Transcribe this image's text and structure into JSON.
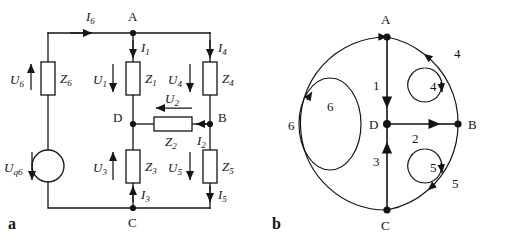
{
  "figure": {
    "captions": {
      "a": "a",
      "b": "b"
    },
    "panel_a": {
      "title": "circuit-diagram",
      "nodes": [
        {
          "id": "A",
          "label": "A",
          "x": 133,
          "y": 33
        },
        {
          "id": "B",
          "label": "B",
          "x": 210,
          "y": 124
        },
        {
          "id": "C",
          "label": "C",
          "x": 133,
          "y": 208
        },
        {
          "id": "D",
          "label": "D",
          "x": 133,
          "y": 124
        }
      ],
      "source": {
        "name": "voltage-source",
        "label_main": "U",
        "label_sub": "q6",
        "arrow": "down",
        "x": 48,
        "y": 166
      },
      "impedances": [
        {
          "name": "Z1",
          "label_main": "Z",
          "label_sub": "1",
          "x": 133,
          "y": 78,
          "orient": "vertical"
        },
        {
          "name": "Z2",
          "label_main": "Z",
          "label_sub": "2",
          "x": 172,
          "y": 124,
          "orient": "horizontal"
        },
        {
          "name": "Z3",
          "label_main": "Z",
          "label_sub": "3",
          "x": 133,
          "y": 166,
          "orient": "vertical"
        },
        {
          "name": "Z4",
          "label_main": "Z",
          "label_sub": "4",
          "x": 210,
          "y": 78,
          "orient": "vertical"
        },
        {
          "name": "Z5",
          "label_main": "Z",
          "label_sub": "5",
          "x": 210,
          "y": 166,
          "orient": "vertical"
        },
        {
          "name": "Z6",
          "label_main": "Z",
          "label_sub": "6",
          "x": 48,
          "y": 78,
          "orient": "vertical"
        }
      ],
      "voltages": [
        {
          "name": "U1",
          "label_main": "U",
          "label_sub": "1",
          "arrow": "down"
        },
        {
          "name": "U2",
          "label_main": "U",
          "label_sub": "2",
          "arrow": "left"
        },
        {
          "name": "U3",
          "label_main": "U",
          "label_sub": "3",
          "arrow": "up"
        },
        {
          "name": "U4",
          "label_main": "U",
          "label_sub": "4",
          "arrow": "down"
        },
        {
          "name": "U5",
          "label_main": "U",
          "label_sub": "5",
          "arrow": "down"
        },
        {
          "name": "U6",
          "label_main": "U",
          "label_sub": "6",
          "arrow": "up"
        }
      ],
      "currents": [
        {
          "name": "I1",
          "label_main": "I",
          "label_sub": "1",
          "arrow": "down"
        },
        {
          "name": "I2",
          "label_main": "I",
          "label_sub": "2",
          "arrow": "left"
        },
        {
          "name": "I3",
          "label_main": "I",
          "label_sub": "3",
          "arrow": "up"
        },
        {
          "name": "I4",
          "label_main": "I",
          "label_sub": "4",
          "arrow": "down"
        },
        {
          "name": "I5",
          "label_main": "I",
          "label_sub": "5",
          "arrow": "down"
        },
        {
          "name": "I6",
          "label_main": "I",
          "label_sub": "6",
          "arrow": "right"
        }
      ]
    },
    "panel_b": {
      "title": "graph-diagram",
      "nodes": [
        {
          "id": "A",
          "label": "A",
          "x": 387,
          "y": 37
        },
        {
          "id": "B",
          "label": "B",
          "x": 458,
          "y": 124
        },
        {
          "id": "C",
          "label": "C",
          "x": 387,
          "y": 210
        },
        {
          "id": "D",
          "label": "D",
          "x": 387,
          "y": 124
        }
      ],
      "branches": [
        {
          "id": "1",
          "label": "1",
          "from": "A",
          "to": "D",
          "direction": "down"
        },
        {
          "id": "2",
          "label": "2",
          "from": "D",
          "to": "B",
          "direction": "right"
        },
        {
          "id": "3",
          "label": "3",
          "from": "C",
          "to": "D",
          "direction": "up"
        },
        {
          "id": "4",
          "label": "4",
          "from": "B",
          "to": "A",
          "direction": "counterclockwise"
        },
        {
          "id": "5",
          "label": "5",
          "from": "B",
          "to": "C",
          "direction": "clockwise"
        },
        {
          "id": "6",
          "label": "6",
          "from": "C",
          "to": "A",
          "direction": "up"
        }
      ],
      "meshes": [
        {
          "id": "4",
          "label": "4",
          "orientation": "clockwise",
          "cx": 425,
          "cy": 85
        },
        {
          "id": "5",
          "label": "5",
          "orientation": "clockwise",
          "cx": 425,
          "cy": 166
        },
        {
          "id": "6",
          "label": "6",
          "orientation": "counterclockwise",
          "cx": 330,
          "cy": 124
        }
      ]
    }
  },
  "colors": {
    "ink": "#141414",
    "background": "#ffffff"
  }
}
